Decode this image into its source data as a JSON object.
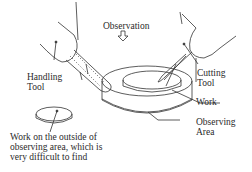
{
  "diagram": {
    "labels": {
      "observation": "Observation",
      "handling_tool_line1": "Handling",
      "handling_tool_line2": "Tool",
      "cutting_tool_line1": "Cutting",
      "cutting_tool_line2": "Tool",
      "work": "Work",
      "observing_area_line1": "Observing",
      "observing_area_line2": "Area",
      "outside_work_line1": "Work on the outside of",
      "outside_work_line2": "observing area, which is",
      "outside_work_line3": "very difficult to find"
    },
    "icons": {
      "observation_arrow": "down-arrow-icon"
    },
    "colors": {
      "line": "#333333",
      "background": "#ffffff"
    }
  }
}
